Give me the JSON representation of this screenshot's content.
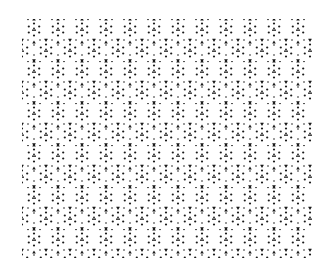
{
  "image": {
    "description": "Black-on-white decorative tessellation of small dots and triangular heart-shaped marks arranged in repeating hexagonal rosettes",
    "colors": {
      "background": "#ffffff",
      "ink": "#1a1a1a"
    },
    "pattern_region": {
      "x": 22,
      "y": 19,
      "width": 290,
      "height": 239
    },
    "tile": {
      "width": 24,
      "height": 42
    }
  }
}
